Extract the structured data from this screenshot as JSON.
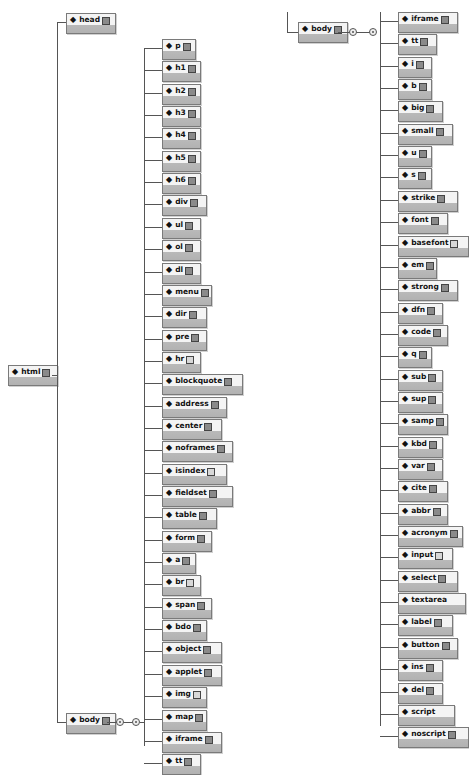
{
  "root": {
    "label": "html",
    "icon": "diamond-icon"
  },
  "level1": [
    {
      "label": "head"
    },
    {
      "label": "body"
    }
  ],
  "body_children_col1": [
    "p",
    "h1",
    "h2",
    "h3",
    "h4",
    "h5",
    "h6",
    "div",
    "ul",
    "ol",
    "dl",
    "menu",
    "dir",
    "pre",
    "hr",
    "blockquote",
    "address",
    "center",
    "noframes",
    "isindex",
    "fieldset",
    "table",
    "form",
    "a",
    "br",
    "span",
    "bdo",
    "object",
    "applet",
    "img",
    "map",
    "iframe",
    "tt"
  ],
  "continuation": {
    "label": "body"
  },
  "body_children_col2": [
    "iframe",
    "tt",
    "i",
    "b",
    "big",
    "small",
    "u",
    "s",
    "strike",
    "font",
    "basefont",
    "em",
    "strong",
    "dfn",
    "code",
    "q",
    "sub",
    "sup",
    "samp",
    "kbd",
    "var",
    "cite",
    "abbr",
    "acronym",
    "input",
    "select",
    "textarea",
    "label",
    "button",
    "ins",
    "del",
    "script",
    "noscript"
  ],
  "empty_expanders": [
    "isindex",
    "br",
    "img",
    "basefont",
    "input",
    "hr"
  ],
  "no_expander": [
    "textarea",
    "script"
  ],
  "colors": {
    "line": "#555555",
    "box_top": "#f4f4f4",
    "box_bottom": "#b4b4b4",
    "box_border": "#7a7a7a"
  }
}
